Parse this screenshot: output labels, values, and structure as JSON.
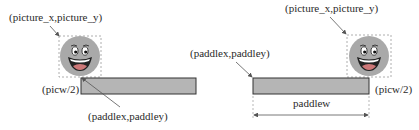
{
  "diagram": {
    "left": {
      "picture_label": "(picture_x,picture_y)",
      "halfwidth_label": "(picw/2)",
      "paddle_label": "(paddlex,paddley)"
    },
    "right": {
      "picture_label": "(picture_x,picture_y)",
      "paddle_label": "(paddlex,paddley)",
      "halfwidth_label": "(picw/2)",
      "width_label": "paddlew"
    },
    "colors": {
      "paddle_fill": "#b5b5b5",
      "paddle_stroke": "#333333",
      "ball_fill": "#a9a9a9",
      "dashed_box": "#999999",
      "arrow": "#555555"
    }
  }
}
